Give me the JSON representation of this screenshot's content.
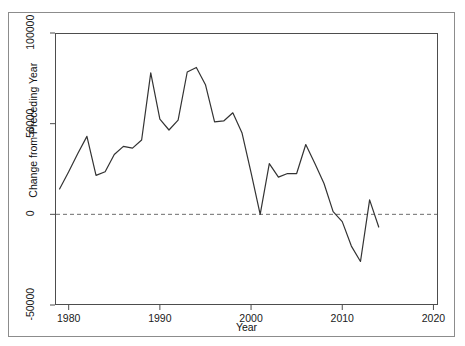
{
  "chart_data": {
    "type": "line",
    "title": "",
    "xlabel": "Year",
    "ylabel": "Change from Preceding Year",
    "xlim": [
      1978.5,
      2020.5
    ],
    "ylim": [
      -50000,
      100000
    ],
    "xticks": [
      1980,
      1990,
      2000,
      2010,
      2020
    ],
    "xtick_labels": [
      "1980",
      "1990",
      "2000",
      "2010",
      "2020"
    ],
    "yticks": [
      -50000,
      0,
      50000,
      100000
    ],
    "ytick_labels": [
      "-50000",
      "0",
      "50000",
      "100000"
    ],
    "grid": false,
    "legend": "none",
    "reference_line": {
      "y": 0,
      "style": "dashed",
      "color": "#6e6e6e"
    },
    "series": [
      {
        "name": "Change from Preceding Year",
        "color": "#333333",
        "x": [
          1979,
          1980,
          1981,
          1982,
          1983,
          1984,
          1985,
          1986,
          1987,
          1988,
          1989,
          1990,
          1991,
          1992,
          1993,
          1994,
          1995,
          1996,
          1997,
          1998,
          1999,
          2000,
          2001,
          2002,
          2003,
          2004,
          2005,
          2006,
          2007,
          2008,
          2009,
          2010,
          2011,
          2012,
          2013,
          2014
        ],
        "y": [
          14000,
          23500,
          33500,
          43000,
          21500,
          23500,
          33000,
          37500,
          36500,
          41000,
          78000,
          52500,
          46500,
          52000,
          78500,
          81000,
          71500,
          51000,
          51500,
          56000,
          45000,
          23000,
          0,
          28000,
          20500,
          22500,
          22500,
          38500,
          28000,
          17000,
          1500,
          -4000,
          -17500,
          -26000,
          8000,
          -7000
        ]
      }
    ]
  },
  "axis": {
    "y_title": "Change from Preceding Year",
    "x_title": "Year"
  }
}
